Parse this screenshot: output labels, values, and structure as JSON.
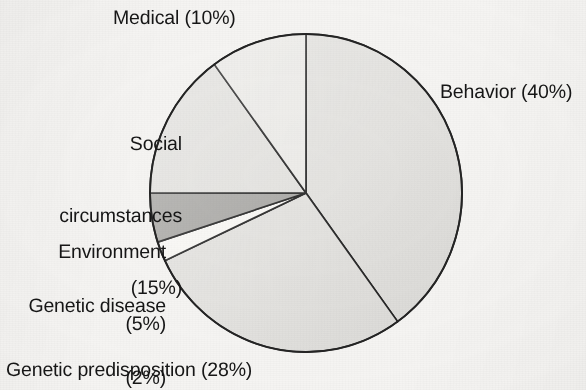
{
  "figure": {
    "background_color": "#f5f4f2",
    "outline_color": "#242424",
    "label_color": "#161616"
  },
  "chart_data": {
    "type": "pie",
    "title": "",
    "subtitle": "",
    "xlabel": "",
    "ylabel": "",
    "legend_position": "none",
    "grid": false,
    "start_angle_deg": 0,
    "direction": "clockwise",
    "total_percent": 100,
    "units": "percent",
    "categories": [
      "Behavior",
      "Genetic predisposition",
      "Genetic disease",
      "Environment",
      "Social circumstances",
      "Medical"
    ],
    "values": [
      40,
      28,
      2,
      5,
      15,
      10
    ],
    "slices": [
      {
        "name": "Behavior",
        "value": 40,
        "label": "Behavior (40%)",
        "color": "#e2e1de",
        "start_deg": 0,
        "end_deg": 144
      },
      {
        "name": "Genetic predisposition",
        "value": 28,
        "label": "Genetic predisposition (28%)",
        "color": "#e2e1de",
        "start_deg": 144,
        "end_deg": 244.8
      },
      {
        "name": "Genetic disease",
        "value": 2,
        "label": "Genetic disease (2%)",
        "color": "#f7f6f3",
        "start_deg": 244.8,
        "end_deg": 252
      },
      {
        "name": "Environment",
        "value": 5,
        "label": "Environment (5%)",
        "color": "#a9a8a5",
        "start_deg": 252,
        "end_deg": 270
      },
      {
        "name": "Social circumstances",
        "value": 15,
        "label": "Social circumstances (15%)",
        "color": "#e2e1de",
        "start_deg": 270,
        "end_deg": 324
      },
      {
        "name": "Medical",
        "value": 10,
        "label": "Medical (10%)",
        "color": "#ebeae7",
        "start_deg": 324,
        "end_deg": 360
      }
    ],
    "labels": {
      "medical": "Medical (10%)",
      "behavior": "Behavior (40%)",
      "social_line1": "Social",
      "social_line2": "circumstances",
      "social_line3": "(15%)",
      "environment_line1": "Environment",
      "environment_line2": "(5%)",
      "genetic_disease_line1": "Genetic disease",
      "genetic_disease_line2": "(2%)",
      "genetic_predisposition": "Genetic predisposition (28%)"
    }
  }
}
